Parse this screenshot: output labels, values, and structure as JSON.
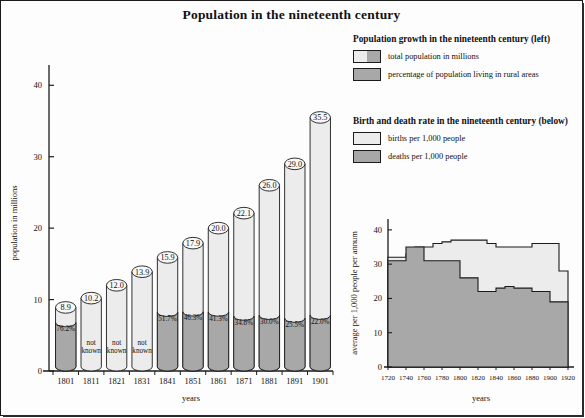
{
  "figure": {
    "title": "Population in the nineteenth century"
  },
  "legend_population": {
    "heading": "Population growth in the nineteenth century (left)",
    "items": [
      {
        "swatch": "split-light-gray",
        "label": "total population in millions"
      },
      {
        "swatch": "gray",
        "label": "percentage of population living in rural areas"
      }
    ]
  },
  "legend_rates": {
    "heading": "Birth and death rate in the nineteenth century (below)",
    "items": [
      {
        "swatch": "light",
        "label": "births per 1,000 people"
      },
      {
        "swatch": "gray",
        "label": "deaths per 1,000 people"
      }
    ]
  },
  "colors": {
    "light_fill": "#ececec",
    "gray_fill": "#a8a8a8",
    "outline": "#1b1b1b",
    "background": "#fdfdfd"
  },
  "chart_data": [
    {
      "type": "bar",
      "id": "population-growth",
      "title": "Population growth in the nineteenth century",
      "xlabel": "years",
      "ylabel": "population in millions",
      "ylim": [
        0,
        42
      ],
      "yticks": [
        0,
        10,
        20,
        30,
        40
      ],
      "ytick_labels": [
        "0",
        "10",
        "20",
        "30",
        "40"
      ],
      "grid": false,
      "categories": [
        "1801",
        "1811",
        "1821",
        "1831",
        "1841",
        "1851",
        "1861",
        "1871",
        "1881",
        "1891",
        "1901"
      ],
      "series": [
        {
          "name": "total population in millions",
          "values": [
            8.9,
            10.2,
            12.0,
            13.9,
            15.9,
            17.9,
            20.0,
            22.1,
            26.0,
            29.0,
            35.5
          ],
          "value_labels": [
            "8.9",
            "10.2",
            "12.0",
            "13.9",
            "15.9",
            "17.9",
            "20.0",
            "22.1",
            "26.0",
            "29.0",
            "35.5"
          ]
        },
        {
          "name": "percentage of population living in rural areas",
          "values": [
            76.2,
            null,
            null,
            null,
            51.7,
            46.3,
            41.3,
            34.8,
            30.0,
            25.5,
            22.0
          ],
          "value_labels": [
            "76.2%",
            "not known",
            "not known",
            "not known",
            "51.7%",
            "46.3%",
            "41.3%",
            "34.8%",
            "30.0%",
            "25.5%",
            "22.0%"
          ],
          "unknown_label": "not known"
        }
      ]
    },
    {
      "type": "area",
      "id": "birth-death-rate",
      "title": "Birth and death rate in the nineteenth century",
      "xlabel": "years",
      "ylabel": "average per 1,000 people per annum",
      "xlim": [
        1720,
        1920
      ],
      "ylim": [
        0,
        42
      ],
      "yticks": [
        0,
        10,
        20,
        30,
        40
      ],
      "ytick_labels": [
        "0",
        "10",
        "20",
        "30",
        "40"
      ],
      "xticks": [
        1720,
        1740,
        1760,
        1780,
        1800,
        1820,
        1840,
        1860,
        1880,
        1900,
        1920
      ],
      "xtick_labels": [
        "1720",
        "1740",
        "1760",
        "1780",
        "1800",
        "1820",
        "1840",
        "1860",
        "1880",
        "1900",
        "1920"
      ],
      "grid": false,
      "step": "post",
      "x": [
        1720,
        1730,
        1740,
        1750,
        1760,
        1770,
        1780,
        1790,
        1800,
        1810,
        1820,
        1830,
        1840,
        1850,
        1860,
        1870,
        1880,
        1890,
        1900,
        1910,
        1920
      ],
      "series": [
        {
          "name": "births per 1,000 people",
          "values": [
            32,
            32,
            33,
            35,
            35,
            36,
            36.5,
            37,
            37,
            37,
            37,
            36,
            35,
            35,
            35,
            35,
            36,
            36,
            36,
            28,
            28
          ]
        },
        {
          "name": "deaths per 1,000 people",
          "values": [
            31,
            31,
            35,
            35,
            31,
            31,
            31,
            31,
            26,
            26,
            22,
            22,
            23,
            23.5,
            23,
            23,
            22,
            22,
            19,
            19,
            15
          ]
        }
      ]
    }
  ]
}
